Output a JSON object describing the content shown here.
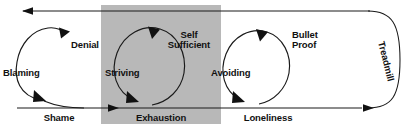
{
  "diagram": {
    "outer_loop_label": "Treadmill",
    "highlight_color": "#b8b8b8",
    "line_color": "#1a1a1a",
    "background_color": "#ffffff",
    "stages": [
      {
        "id": "shame",
        "label": "Shame",
        "highlighted": false
      },
      {
        "id": "exhaustion",
        "label": "Exhaustion",
        "highlighted": true
      },
      {
        "id": "loneliness",
        "label": "Loneliness",
        "highlighted": false
      }
    ],
    "loops": [
      {
        "id": "shame-loop",
        "left_label": "Blaming",
        "top_label": "Denial",
        "top_label_line2": "",
        "stage": "Shame"
      },
      {
        "id": "exhaustion-loop",
        "left_label": "Striving",
        "top_label": "Self",
        "top_label_line2": "Sufficient",
        "stage": "Exhaustion"
      },
      {
        "id": "loneliness-loop",
        "left_label": "Avoiding",
        "top_label": "Bullet",
        "top_label_line2": "Proof",
        "stage": "Loneliness"
      }
    ]
  }
}
